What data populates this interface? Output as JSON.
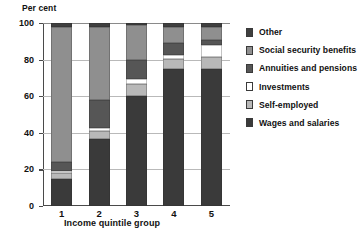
{
  "chart_data": {
    "type": "bar",
    "subtype": "stacked-100-percent",
    "title": "",
    "ylabel": "Per cent",
    "xlabel": "Income quintile group",
    "categories": [
      "1",
      "2",
      "3",
      "4",
      "5"
    ],
    "ylim": [
      0,
      100
    ],
    "yticks": [
      0,
      20,
      40,
      60,
      80,
      100
    ],
    "grid": true,
    "legend_position": "right",
    "series": [
      {
        "name": "Wages and salaries",
        "color": "#3a3a3a",
        "values": [
          14.8,
          36.6,
          60.0,
          75.0,
          75.0
        ]
      },
      {
        "name": "Self-employed",
        "color": "#b8b8b8",
        "values": [
          3.0,
          4.4,
          6.5,
          5.5,
          6.6
        ]
      },
      {
        "name": "Investments",
        "color": "#ffffff",
        "values": [
          1.6,
          1.6,
          2.7,
          2.2,
          6.6
        ]
      },
      {
        "name": "Annuities and pensions",
        "color": "#565656",
        "values": [
          4.4,
          15.4,
          10.4,
          6.6,
          2.7
        ]
      },
      {
        "name": "Social security benefits",
        "color": "#8f8f8f",
        "values": [
          74.2,
          40.0,
          19.4,
          8.7,
          7.1
        ]
      },
      {
        "name": "Other",
        "color": "#3f3f3f",
        "values": [
          2.0,
          2.0,
          1.0,
          2.0,
          2.0
        ]
      }
    ]
  },
  "legend": {
    "items": [
      {
        "label": "Other",
        "color": "#3f3f3f"
      },
      {
        "label": "Social security benefits",
        "color": "#8f8f8f"
      },
      {
        "label": "Annuities and pensions",
        "color": "#565656"
      },
      {
        "label": "Investments",
        "color": "#ffffff"
      },
      {
        "label": "Self-employed",
        "color": "#b8b8b8"
      },
      {
        "label": "Wages and salaries",
        "color": "#3a3a3a"
      }
    ]
  }
}
